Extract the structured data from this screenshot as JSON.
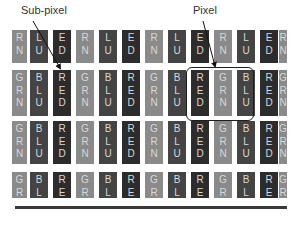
{
  "labels": {
    "subpixel": "Sub-pixel",
    "pixel": "Pixel"
  },
  "colors": {
    "RED": "#2c2c2c",
    "GRN": "#8a8a8a",
    "BLU": "#444444",
    "text": "#d8d8d8",
    "background": "#ffffff"
  },
  "subpixel_types": {
    "RED": [
      "R",
      "E",
      "D"
    ],
    "GRN": [
      "G",
      "R",
      "N"
    ],
    "BLU": [
      "B",
      "L",
      "U"
    ]
  },
  "column_pattern": [
    "GRN",
    "BLU",
    "RED",
    "GRN",
    "BLU",
    "RED",
    "GRN",
    "BLU",
    "RED",
    "GRN",
    "BLU",
    "RED",
    "GRN"
  ],
  "rows": [
    {
      "index": 1,
      "visible_letters": "last-two",
      "cropped": "top"
    },
    {
      "index": 2,
      "visible_letters": "all"
    },
    {
      "index": 3,
      "visible_letters": "all"
    },
    {
      "index": 4,
      "visible_letters": "first-two",
      "cropped": "bottom"
    }
  ],
  "pixel_highlight": {
    "columns": [
      "RED",
      "GRN",
      "BLU"
    ],
    "row": 2
  }
}
